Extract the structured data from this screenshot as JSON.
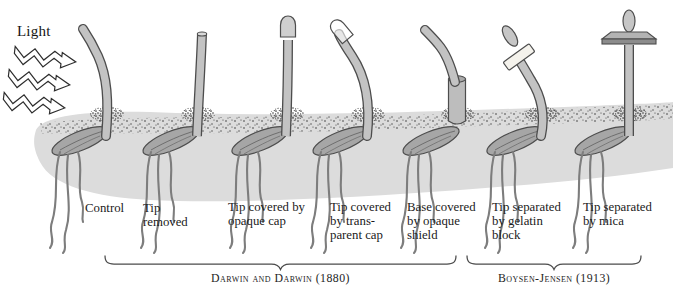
{
  "light": {
    "label": "Light",
    "x": 17,
    "y": 23,
    "arrow_count": 3
  },
  "colors": {
    "background": "#ffffff",
    "stem_fill": "#c3c3c3",
    "stem_outline": "#4d4d4d",
    "seed_fill": "#a6a6a6",
    "seed_outline": "#4d4d4d",
    "seed_detail": "#6e6e6e",
    "root": "#7d7d7d",
    "ground": "#dcdcdc",
    "speckle": "#3a3a3a",
    "cut_top": "#d9d9d9",
    "opaque_cap": "#cfcfcf",
    "transparent_cap": "rgba(255,255,255,0.6)",
    "cylinder": "#bdbdbd",
    "cylinder_rim": "#a9a9a9",
    "gelatin": "#f4f2ec",
    "mica_top": "#b3b3b3",
    "mica_front": "#8c8c8c",
    "tip_fill": "#c6c6c6",
    "arrow_fill": "#ffffff",
    "arrow_outline": "#2e2e2e",
    "brace": "#4b4b4b",
    "text": "#1b1b1b"
  },
  "seedlings": [
    {
      "name": "control",
      "label": "Control",
      "variant": "bent",
      "base_x": 106,
      "label_x": 85,
      "label_y": 202
    },
    {
      "name": "tip-removed",
      "label": "Tip\nremoved",
      "variant": "cut",
      "base_x": 197,
      "label_x": 143,
      "label_y": 202
    },
    {
      "name": "tip-opaque-cap",
      "label": "Tip covered by\nopaque cap",
      "variant": "opaque_cap",
      "base_x": 286,
      "label_x": 228,
      "label_y": 201
    },
    {
      "name": "tip-transparent-cap",
      "label": "Tip covered\nby trans-\nparent cap",
      "variant": "transparent_cap",
      "base_x": 367,
      "label_x": 330,
      "label_y": 201
    },
    {
      "name": "base-opaque-shield",
      "label": "Base covered\nby opaque\nshield",
      "variant": "base_shield",
      "base_x": 457,
      "label_x": 407,
      "label_y": 201
    },
    {
      "name": "tip-gelatin-block",
      "label": "Tip separated\nby gelatin\nblock",
      "variant": "gelatin_block",
      "base_x": 541,
      "label_x": 492,
      "label_y": 201
    },
    {
      "name": "tip-mica",
      "label": "Tip separated\nby mica",
      "variant": "mica",
      "base_x": 629,
      "label_x": 583,
      "label_y": 201
    }
  ],
  "brackets": [
    {
      "label": "Darwin and Darwin (1880)",
      "x1": 105,
      "x2": 456
    },
    {
      "label": "Boysen-Jensen (1913)",
      "x1": 467,
      "x2": 641
    }
  ]
}
